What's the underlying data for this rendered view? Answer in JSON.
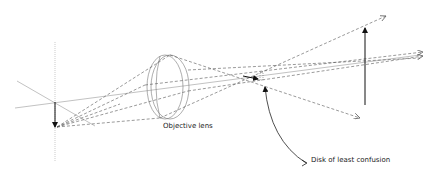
{
  "diagram": {
    "labels": {
      "objective_lens": "Objective lens",
      "disk_of_least_confusion": "Disk of least confusion"
    },
    "colors": {
      "ray": "#555555",
      "axis": "#999999",
      "arrow": "#111111",
      "text": "#222222"
    }
  }
}
